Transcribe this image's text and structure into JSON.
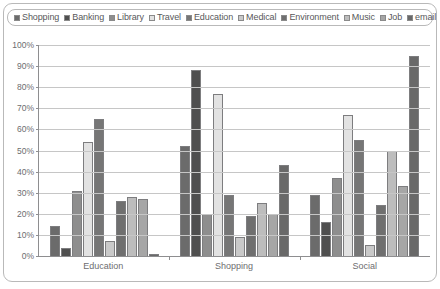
{
  "chart_data": {
    "type": "bar",
    "title": "",
    "subtitle": "",
    "xlabel": "",
    "ylabel": "",
    "categories": [
      "Education",
      "Shopping",
      "Social"
    ],
    "ylim": [
      0,
      100
    ],
    "ytick_labels": [
      "0%",
      "10%",
      "20%",
      "30%",
      "40%",
      "50%",
      "60%",
      "70%",
      "80%",
      "90%",
      "100%"
    ],
    "ytick_values": [
      0,
      10,
      20,
      30,
      40,
      50,
      60,
      70,
      80,
      90,
      100
    ],
    "grid": true,
    "legend_position": "top",
    "series": [
      {
        "name": "Shopping",
        "color": "#6b6b6b",
        "values": [
          14,
          52,
          29
        ]
      },
      {
        "name": "Banking",
        "color": "#4f4f4f",
        "values": [
          4,
          88,
          16
        ]
      },
      {
        "name": "Library",
        "color": "#8e8e8e",
        "values": [
          31,
          20,
          37
        ]
      },
      {
        "name": "Travel",
        "color": "#e2e2e2",
        "values": [
          54,
          77,
          67
        ]
      },
      {
        "name": "Education",
        "color": "#767676",
        "values": [
          65,
          29,
          55
        ]
      },
      {
        "name": "Medical",
        "color": "#c9c9c9",
        "values": [
          7,
          9,
          5
        ]
      },
      {
        "name": "Environment",
        "color": "#6f6f6f",
        "values": [
          26,
          19,
          24
        ]
      },
      {
        "name": "Music",
        "color": "#bdbdbd",
        "values": [
          28,
          25,
          50
        ]
      },
      {
        "name": "Job",
        "color": "#a6a6a6",
        "values": [
          27,
          20,
          33
        ]
      },
      {
        "name": "email",
        "color": "#696969",
        "values": [
          1,
          43,
          95
        ]
      }
    ]
  }
}
